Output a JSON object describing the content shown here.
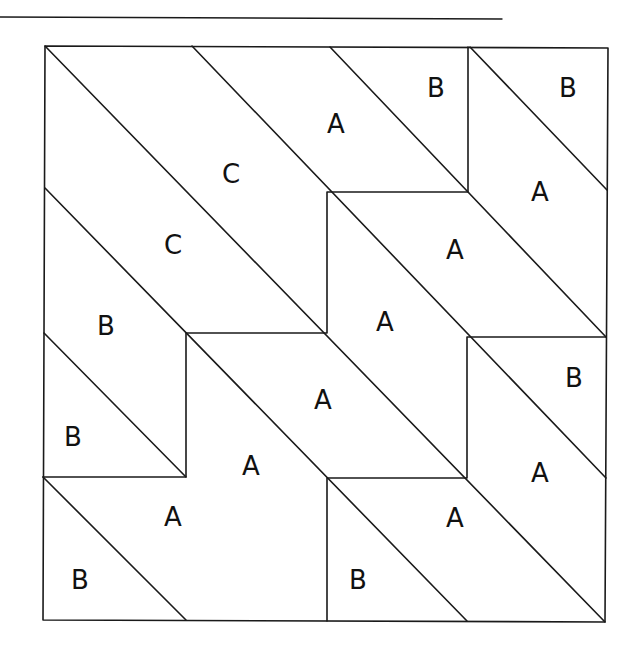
{
  "diagram": {
    "type": "quilt-block-tiling",
    "line_color": "#1a1a1a",
    "background": "#ffffff",
    "labels": [
      {
        "text": "B",
        "x": 436,
        "y": 88
      },
      {
        "text": "B",
        "x": 568,
        "y": 88
      },
      {
        "text": "A",
        "x": 336,
        "y": 124
      },
      {
        "text": "C",
        "x": 231,
        "y": 174
      },
      {
        "text": "A",
        "x": 540,
        "y": 192
      },
      {
        "text": "C",
        "x": 173,
        "y": 245
      },
      {
        "text": "A",
        "x": 455,
        "y": 250
      },
      {
        "text": "B",
        "x": 106,
        "y": 326
      },
      {
        "text": "A",
        "x": 385,
        "y": 322
      },
      {
        "text": "B",
        "x": 574,
        "y": 378
      },
      {
        "text": "A",
        "x": 323,
        "y": 400
      },
      {
        "text": "B",
        "x": 73,
        "y": 437
      },
      {
        "text": "A",
        "x": 251,
        "y": 466
      },
      {
        "text": "A",
        "x": 540,
        "y": 473
      },
      {
        "text": "A",
        "x": 173,
        "y": 517
      },
      {
        "text": "A",
        "x": 455,
        "y": 518
      },
      {
        "text": "B",
        "x": 80,
        "y": 580
      },
      {
        "text": "B",
        "x": 358,
        "y": 580
      }
    ]
  }
}
